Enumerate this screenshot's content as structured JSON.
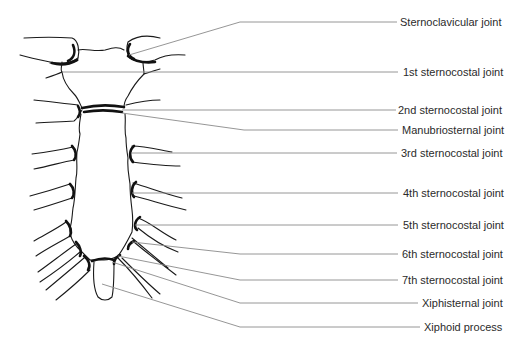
{
  "figure": {
    "colors": {
      "line_art": "#1a1a1a",
      "leader_lines": "#8a8a8a",
      "label_text": "#2b2b2b",
      "background": "#ffffff"
    },
    "labels": [
      {
        "text": "Sternoclavicular joint",
        "x": 400,
        "y": 17
      },
      {
        "text": "1st sternocostal joint",
        "x": 403,
        "y": 67
      },
      {
        "text": "2nd sternocostal joint",
        "x": 398,
        "y": 105
      },
      {
        "text": "Manubriosternal joint",
        "x": 402,
        "y": 125
      },
      {
        "text": "3rd sternocostal joint",
        "x": 401,
        "y": 147
      },
      {
        "text": "4th sternocostal joint",
        "x": 403,
        "y": 186
      },
      {
        "text": "5th sternocostal joint",
        "x": 403,
        "y": 221
      },
      {
        "text": "6th sternocostal joint",
        "x": 402,
        "y": 249
      },
      {
        "text": "7th sternocostal joint",
        "x": 402,
        "y": 274
      },
      {
        "text": "Xiphisternal joint",
        "x": 422,
        "y": 297
      },
      {
        "text": "Xiphoid process",
        "x": 424,
        "y": 320
      }
    ]
  }
}
